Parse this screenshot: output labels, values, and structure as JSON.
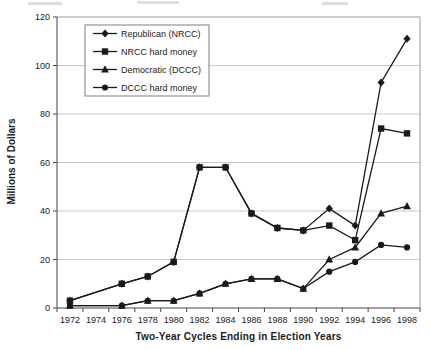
{
  "colors": {
    "ink": "#1a1a1a",
    "grid": "#c9c9c9",
    "frame": "#999999",
    "axis": "#444444",
    "background": "#ffffff"
  },
  "chart_data": {
    "type": "line",
    "title": "",
    "xlabel": "Two-Year Cycles Ending in Election Years",
    "ylabel": "Millions of Dollars",
    "x": [
      1972,
      1974,
      1976,
      1978,
      1980,
      1982,
      1984,
      1986,
      1988,
      1990,
      1992,
      1994,
      1996,
      1998
    ],
    "ylim": [
      0,
      120
    ],
    "ytick_interval": 20,
    "yticks": [
      0,
      20,
      40,
      60,
      80,
      100,
      120
    ],
    "grid": "horizontal",
    "legend_position": "top-left-inside",
    "legend_entries": [
      "Republican (NRCC)",
      "NRCC hard money",
      "Democratic (DCCC)",
      "DCCC hard money"
    ],
    "series": [
      {
        "name": "Republican (NRCC)",
        "marker": "diamond",
        "values": [
          3,
          null,
          10,
          13,
          19,
          58,
          58,
          39,
          33,
          32,
          41,
          34,
          93,
          111
        ]
      },
      {
        "name": "NRCC hard money",
        "marker": "square",
        "values": [
          3,
          null,
          10,
          13,
          19,
          58,
          58,
          39,
          33,
          32,
          34,
          28,
          74,
          72
        ]
      },
      {
        "name": "Democratic (DCCC)",
        "marker": "triangle",
        "values": [
          1,
          null,
          1,
          3,
          3,
          6,
          10,
          12,
          12,
          8,
          20,
          25,
          39,
          42
        ]
      },
      {
        "name": "DCCC hard money",
        "marker": "circle",
        "values": [
          1,
          null,
          1,
          3,
          3,
          6,
          10,
          12,
          12,
          8,
          15,
          19,
          26,
          25
        ]
      }
    ]
  }
}
